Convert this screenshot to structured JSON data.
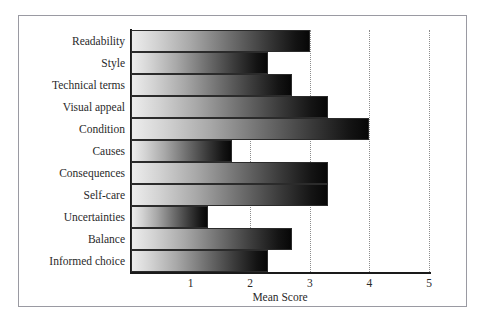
{
  "caption_remnant": "",
  "chart_data": {
    "type": "bar",
    "orientation": "horizontal",
    "title": "",
    "xlabel": "Mean Score",
    "ylabel": "",
    "xlim": [
      0,
      5
    ],
    "xticks": [
      "1",
      "2",
      "3",
      "4",
      "5"
    ],
    "xtick_values": [
      1,
      2,
      3,
      4,
      5
    ],
    "grid": "vertical dotted gridlines at each x tick",
    "legend": "none",
    "bar_style": "horizontal gradient light-gray to black, thin dark outline",
    "categories": [
      "Readability",
      "Style",
      "Technical terms",
      "Visual appeal",
      "Condition",
      "Causes",
      "Consequences",
      "Self-care",
      "Uncertainties",
      "Balance",
      "Informed choice"
    ],
    "values": [
      3.0,
      2.3,
      2.7,
      3.3,
      4.0,
      1.7,
      3.3,
      3.3,
      1.3,
      2.7,
      2.3
    ]
  },
  "colors": {
    "frame": "#9a9aa2",
    "axis": "#1a1a1a",
    "gridline": "#8d8d8d",
    "text": "#2a2a2a",
    "bar_gradient_start": "#ededed",
    "bar_gradient_end": "#070707",
    "background": "#ffffff"
  }
}
